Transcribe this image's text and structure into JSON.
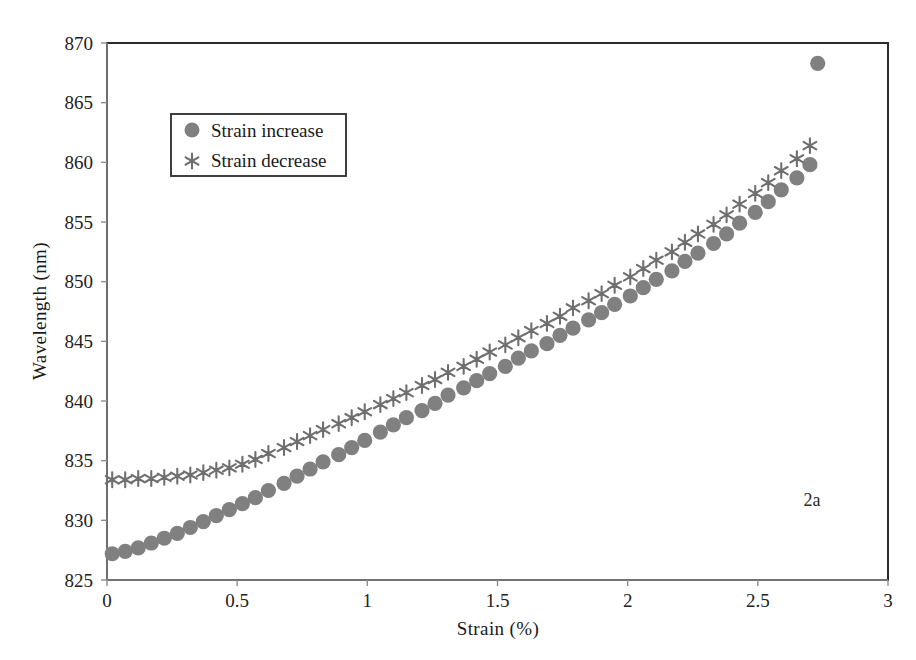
{
  "figure": {
    "annotation": "2a",
    "marker_color": "#808080",
    "frame_color": "#2b2b2b",
    "axis_color": "#8d8d8d"
  },
  "legend": {
    "position": "upper-left",
    "entries": [
      {
        "label": "Strain increase",
        "marker": "circle"
      },
      {
        "label": "Strain decrease",
        "marker": "star"
      }
    ]
  },
  "chart_data": {
    "type": "scatter",
    "title": "",
    "xlabel": "Strain (%)",
    "ylabel": "Wavelength (nm)",
    "xlim": [
      0,
      3
    ],
    "ylim": [
      825,
      870
    ],
    "xticks": [
      0,
      0.5,
      1,
      1.5,
      2,
      2.5,
      3
    ],
    "xtick_labels": [
      "0",
      "0.5",
      "1",
      "1.5",
      "2",
      "2.5",
      "3"
    ],
    "yticks": [
      825,
      830,
      835,
      840,
      845,
      850,
      855,
      860,
      865,
      870
    ],
    "ytick_labels": [
      "825",
      "830",
      "835",
      "840",
      "845",
      "850",
      "855",
      "860",
      "865",
      "870"
    ],
    "grid": false,
    "annotations": [
      {
        "text": "2a",
        "x": 2.55,
        "y": 831.5
      }
    ],
    "series": [
      {
        "name": "Strain increase",
        "marker": "circle",
        "color": "#808080",
        "x": [
          0.02,
          0.07,
          0.12,
          0.17,
          0.22,
          0.27,
          0.32,
          0.37,
          0.42,
          0.47,
          0.52,
          0.57,
          0.62,
          0.68,
          0.73,
          0.78,
          0.83,
          0.89,
          0.94,
          0.99,
          1.05,
          1.1,
          1.15,
          1.21,
          1.26,
          1.31,
          1.37,
          1.42,
          1.47,
          1.53,
          1.58,
          1.63,
          1.69,
          1.74,
          1.79,
          1.85,
          1.9,
          1.95,
          2.01,
          2.06,
          2.11,
          2.17,
          2.22,
          2.27,
          2.33,
          2.38,
          2.43,
          2.49,
          2.54,
          2.59,
          2.65,
          2.7,
          2.73
        ],
        "y": [
          827.2,
          827.4,
          827.7,
          828.1,
          828.5,
          828.9,
          829.4,
          829.9,
          830.4,
          830.9,
          831.4,
          831.9,
          832.5,
          833.1,
          833.7,
          834.3,
          834.9,
          835.5,
          836.1,
          836.7,
          837.4,
          838.0,
          838.6,
          839.2,
          839.8,
          840.5,
          841.1,
          841.7,
          842.3,
          842.9,
          843.6,
          844.2,
          844.8,
          845.5,
          846.1,
          846.8,
          847.4,
          848.1,
          848.8,
          849.5,
          850.2,
          850.9,
          851.7,
          852.4,
          853.2,
          854.0,
          854.9,
          855.8,
          856.7,
          857.7,
          858.7,
          859.8,
          868.3
        ]
      },
      {
        "name": "Strain decrease",
        "marker": "star",
        "color": "#6f6f6f",
        "x": [
          0.02,
          0.07,
          0.12,
          0.17,
          0.22,
          0.27,
          0.32,
          0.37,
          0.42,
          0.47,
          0.52,
          0.57,
          0.62,
          0.68,
          0.73,
          0.78,
          0.83,
          0.89,
          0.94,
          0.99,
          1.05,
          1.1,
          1.15,
          1.21,
          1.26,
          1.31,
          1.37,
          1.42,
          1.47,
          1.53,
          1.58,
          1.63,
          1.69,
          1.74,
          1.79,
          1.85,
          1.9,
          1.95,
          2.01,
          2.06,
          2.11,
          2.17,
          2.22,
          2.27,
          2.33,
          2.38,
          2.43,
          2.49,
          2.54,
          2.59,
          2.65,
          2.7
        ],
        "y": [
          833.4,
          833.4,
          833.5,
          833.5,
          833.6,
          833.7,
          833.8,
          834.0,
          834.2,
          834.4,
          834.7,
          835.1,
          835.6,
          836.1,
          836.6,
          837.1,
          837.6,
          838.1,
          838.6,
          839.1,
          839.7,
          840.2,
          840.7,
          841.3,
          841.8,
          842.4,
          842.9,
          843.5,
          844.1,
          844.7,
          845.3,
          845.9,
          846.5,
          847.1,
          847.8,
          848.4,
          849.0,
          849.7,
          850.4,
          851.1,
          851.8,
          852.5,
          853.3,
          854.0,
          854.8,
          855.6,
          856.5,
          857.4,
          858.3,
          859.3,
          860.3,
          861.4
        ]
      }
    ]
  }
}
